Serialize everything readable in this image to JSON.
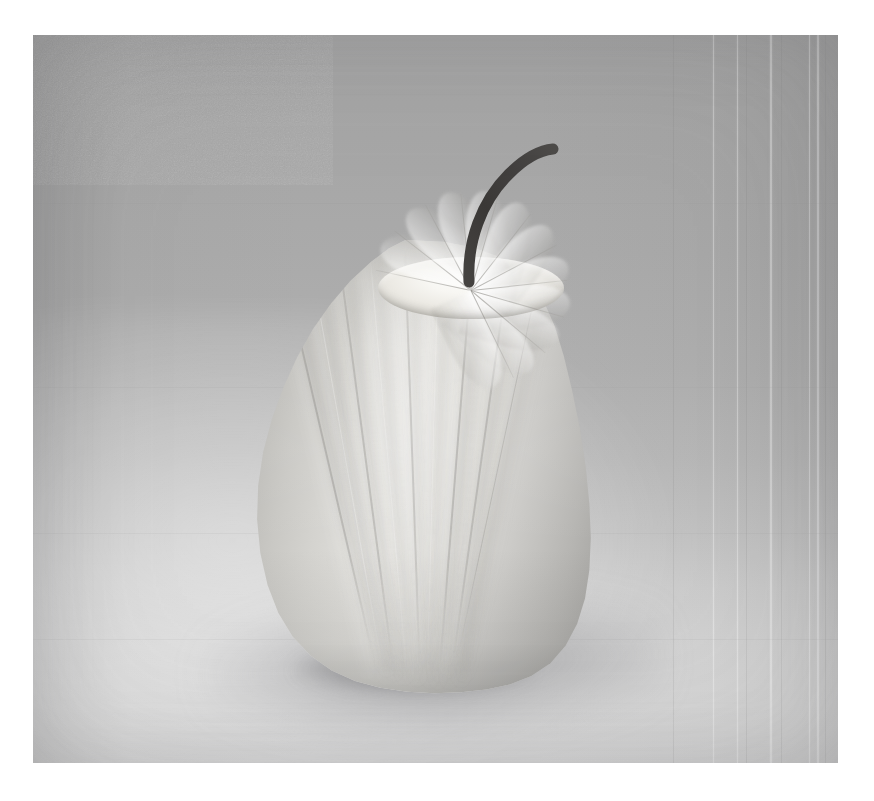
{
  "page": {
    "background_color": "#ffffff",
    "width": 874,
    "height": 801,
    "caption": ""
  },
  "photo": {
    "label": "paper-pear-still-life",
    "alt_text": "Black and white photograph of a sculpture of a pear folded from white paper, with a dark curved stem, standing on a pale surface",
    "x": 33,
    "y": 35,
    "width": 805,
    "height": 728,
    "medium": "grayscale photograph",
    "background_color": "#b3b3b3",
    "background_top_color": "#a3a3a3",
    "background_bottom_color": "#d8d8d8",
    "subject_color": "#dcdbd7",
    "subject_shadow_color": "#a4a39f",
    "highlight_color": "#fdfdfb",
    "stem_color": "#3c3a38",
    "shadow_color": "#6a6a6e"
  },
  "subject": {
    "name": "paper-pear-sculpture",
    "material": "folded paper",
    "body": {
      "name": "pear-body",
      "x": 205,
      "y": 205,
      "width": 360,
      "height": 455,
      "pleat_count": 9,
      "pleats": [
        {
          "offset": 11.0,
          "width": 1.6,
          "tilt": -13.0,
          "curve": 54,
          "tone": "dark",
          "strength": 0.34
        },
        {
          "offset": 19.5,
          "width": 1.4,
          "tilt": -10.0,
          "curve": 50,
          "tone": "light",
          "strength": 0.3
        },
        {
          "offset": 27.5,
          "width": 1.6,
          "tilt": -7.5,
          "curve": 48,
          "tone": "dark",
          "strength": 0.3
        },
        {
          "offset": 36.5,
          "width": 1.4,
          "tilt": -5.0,
          "curve": 46,
          "tone": "light",
          "strength": 0.26
        },
        {
          "offset": 46.0,
          "width": 1.6,
          "tilt": -2.0,
          "curve": 45,
          "tone": "dark",
          "strength": 0.26
        },
        {
          "offset": 55.5,
          "width": 1.4,
          "tilt": 1.5,
          "curve": 45,
          "tone": "light",
          "strength": 0.24
        },
        {
          "offset": 65.0,
          "width": 1.8,
          "tilt": 4.5,
          "curve": 46,
          "tone": "dark",
          "strength": 0.32
        },
        {
          "offset": 75.5,
          "width": 1.6,
          "tilt": 8.0,
          "curve": 48,
          "tone": "dark",
          "strength": 0.3
        },
        {
          "offset": 85.0,
          "width": 1.4,
          "tilt": 12.0,
          "curve": 52,
          "tone": "dark",
          "strength": 0.26
        }
      ]
    },
    "rosette": {
      "name": "paper-rosette-crown",
      "x": 345,
      "y": 222,
      "width": 186,
      "height": 62,
      "fold_count": 11,
      "fold_angles": [
        -168,
        -142,
        -118,
        -96,
        -74,
        -52,
        -28,
        -6,
        16,
        40,
        64
      ]
    },
    "stem": {
      "name": "pear-stem",
      "x": 390,
      "y": 95,
      "width": 180,
      "height": 175,
      "path": "M 46 152 C 44 112, 58 72, 86 44 C 104 26, 120 20, 130 19",
      "thickness": 11,
      "color": "#3c3a38"
    },
    "shadows": {
      "cast": {
        "name": "cast-shadow",
        "x": 170,
        "y": 560,
        "width": 460,
        "height": 140
      },
      "contact": {
        "name": "contact-shadow",
        "x": 262,
        "y": 612,
        "width": 238,
        "height": 46
      }
    }
  },
  "artifacts": {
    "name": "scan-streaks",
    "vertical_streaks": [
      {
        "x": 640,
        "tone": "dark",
        "width": 1
      },
      {
        "x": 680,
        "tone": "light",
        "width": 1
      },
      {
        "x": 704,
        "tone": "light",
        "width": 1
      },
      {
        "x": 713,
        "tone": "dark",
        "width": 1
      },
      {
        "x": 737,
        "tone": "light",
        "width": 2
      },
      {
        "x": 748,
        "tone": "dark",
        "width": 1
      },
      {
        "x": 776,
        "tone": "light",
        "width": 1
      },
      {
        "x": 784,
        "tone": "light",
        "width": 2
      },
      {
        "x": 792,
        "tone": "dark",
        "width": 1
      }
    ],
    "horizontal_seams": [
      168,
      352,
      498,
      604
    ]
  }
}
